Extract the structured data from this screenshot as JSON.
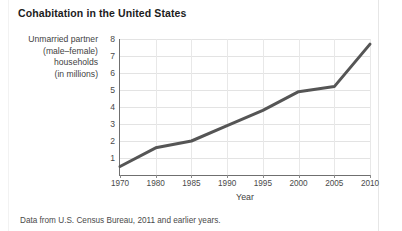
{
  "figure": {
    "title": "Cohabitation in the United States",
    "footnote": "Data from U.S. Census Bureau, 2011 and earlier years."
  },
  "axis": {
    "ylabel_lines": [
      "Unmarried partner",
      "(male–female)",
      "households",
      "(in millions)"
    ],
    "xlabel": "Year"
  },
  "chart_data": {
    "type": "line",
    "title": "Cohabitation in the United States",
    "xlabel": "Year",
    "ylabel": "Unmarried partner (male–female) households (in millions)",
    "categories": [
      "1970",
      "1980",
      "1985",
      "1990",
      "1995",
      "2000",
      "2005",
      "2010"
    ],
    "values": [
      0.5,
      1.6,
      2.0,
      2.9,
      3.8,
      4.9,
      5.2,
      7.7
    ],
    "series": [
      {
        "name": "Unmarried partner (male–female) households",
        "values": [
          0.5,
          1.6,
          2.0,
          2.9,
          3.8,
          4.9,
          5.2,
          7.7
        ]
      }
    ],
    "ylim": [
      0,
      8
    ],
    "yticks": [
      1,
      2,
      3,
      4,
      5,
      6,
      7,
      8
    ],
    "ytick_labels": [
      "1",
      "2",
      "3",
      "4",
      "5",
      "6",
      "7",
      "8"
    ],
    "xtick_labels": [
      "1970",
      "1980",
      "1985",
      "1990",
      "1995",
      "2000",
      "2005",
      "2010"
    ],
    "x_spacing": "equal",
    "grid": true,
    "legend": "none",
    "line_color": "#555555",
    "line_width": 3,
    "markers": false,
    "source": "Data from U.S. Census Bureau, 2011 and earlier years."
  }
}
